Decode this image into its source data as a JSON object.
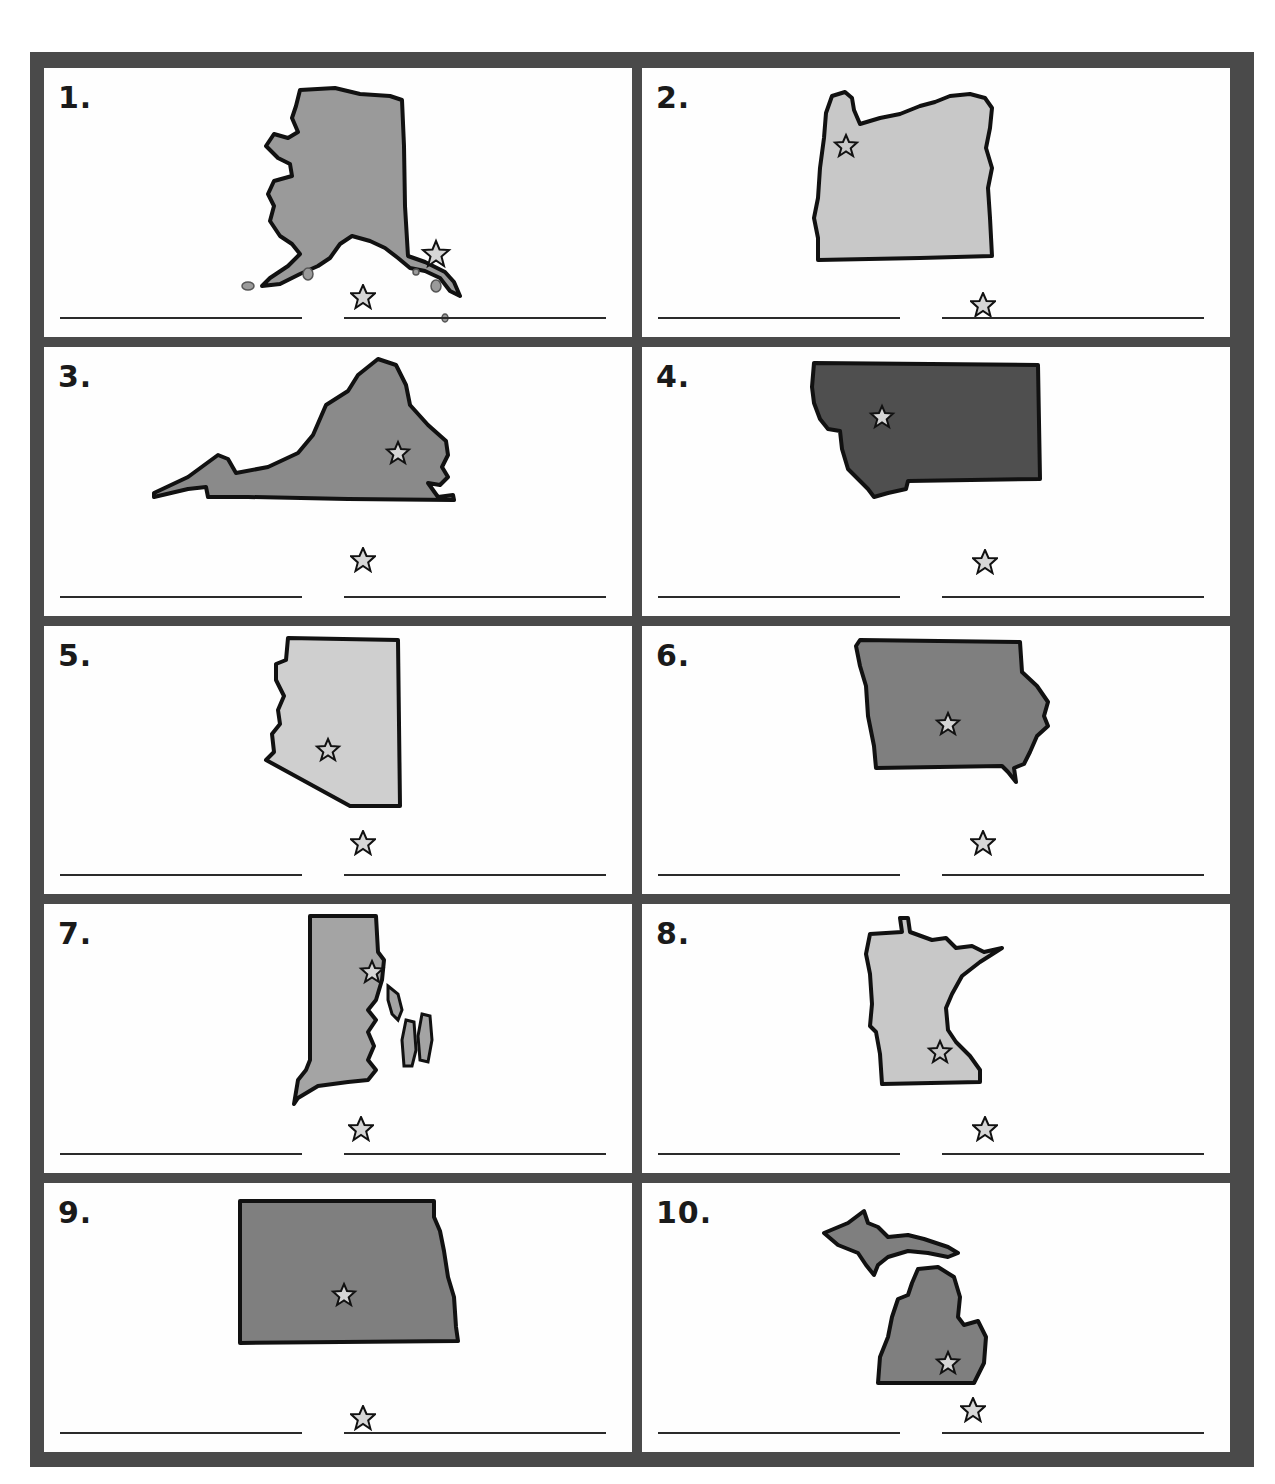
{
  "worksheet": {
    "title": "State and Capital Identification",
    "colors": {
      "frame": "#4a4a4a",
      "light_fill": "#c8c8c8",
      "medium_fill": "#8a8a8a",
      "dark_fill": "#4f4f4f",
      "outline": "#111111",
      "star_fill": "#d6d6d6"
    },
    "panels": [
      {
        "number": "1.",
        "state_shape": "alaska",
        "fill": "medium-light",
        "capital_star": true,
        "answer_star_icon": "star-icon",
        "state_answer": "",
        "capital_answer": ""
      },
      {
        "number": "2.",
        "state_shape": "oregon",
        "fill": "light",
        "capital_star": true,
        "answer_star_icon": "star-icon",
        "state_answer": "",
        "capital_answer": ""
      },
      {
        "number": "3.",
        "state_shape": "virginia",
        "fill": "medium",
        "capital_star": true,
        "answer_star_icon": "star-icon",
        "state_answer": "",
        "capital_answer": ""
      },
      {
        "number": "4.",
        "state_shape": "montana",
        "fill": "dark",
        "capital_star": true,
        "answer_star_icon": "star-icon",
        "state_answer": "",
        "capital_answer": ""
      },
      {
        "number": "5.",
        "state_shape": "arizona",
        "fill": "light",
        "capital_star": true,
        "answer_star_icon": "star-icon",
        "state_answer": "",
        "capital_answer": ""
      },
      {
        "number": "6.",
        "state_shape": "iowa",
        "fill": "medium",
        "capital_star": true,
        "answer_star_icon": "star-icon",
        "state_answer": "",
        "capital_answer": ""
      },
      {
        "number": "7.",
        "state_shape": "rhode-island",
        "fill": "medium-light",
        "capital_star": true,
        "answer_star_icon": "star-icon",
        "state_answer": "",
        "capital_answer": ""
      },
      {
        "number": "8.",
        "state_shape": "minnesota",
        "fill": "light",
        "capital_star": true,
        "answer_star_icon": "star-icon",
        "state_answer": "",
        "capital_answer": ""
      },
      {
        "number": "9.",
        "state_shape": "north-dakota",
        "fill": "medium",
        "capital_star": true,
        "answer_star_icon": "star-icon",
        "state_answer": "",
        "capital_answer": ""
      },
      {
        "number": "10.",
        "state_shape": "michigan",
        "fill": "medium",
        "capital_star": true,
        "answer_star_icon": "star-icon",
        "state_answer": "",
        "capital_answer": ""
      }
    ]
  }
}
